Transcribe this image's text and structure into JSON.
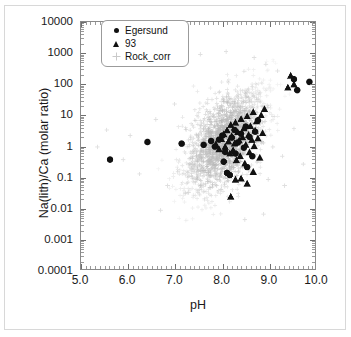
{
  "chart_data": {
    "type": "scatter",
    "title": "",
    "xlabel": "pH",
    "ylabel": "Na(lith)/Ca (molar ratio)",
    "xlim": [
      5.0,
      10.0
    ],
    "ylim": [
      0.0001,
      10000
    ],
    "yscale": "log",
    "xscale": "linear",
    "grid": false,
    "legend_position": "top-left-inside",
    "xticks": [
      "5.0",
      "6.0",
      "7.0",
      "8.0",
      "9.0",
      "10.0"
    ],
    "xtick_values": [
      5.0,
      6.0,
      7.0,
      8.0,
      9.0,
      10.0
    ],
    "yticks": [
      "10000",
      "1000",
      "100",
      "10",
      "1",
      "0.1",
      "0.01",
      "0.001",
      "0.0001"
    ],
    "ytick_values": [
      10000,
      1000,
      100,
      10,
      1,
      0.1,
      0.01,
      0.001,
      0.0001
    ],
    "series": [
      {
        "name": "Egersund",
        "marker": "circle",
        "color": "#111111",
        "size": 6,
        "points": [
          [
            5.62,
            0.35
          ],
          [
            6.42,
            1.3
          ],
          [
            7.15,
            1.15
          ],
          [
            7.62,
            1.05
          ],
          [
            7.78,
            1.4
          ],
          [
            7.86,
            0.92
          ],
          [
            7.95,
            1.55
          ],
          [
            8.02,
            2.1
          ],
          [
            8.08,
            0.62
          ],
          [
            8.05,
            0.3
          ],
          [
            8.12,
            0.13
          ],
          [
            8.18,
            0.11
          ],
          [
            8.22,
            1.8
          ],
          [
            8.28,
            3.2
          ],
          [
            8.3,
            0.55
          ],
          [
            8.35,
            1.25
          ],
          [
            8.42,
            2.4
          ],
          [
            8.48,
            0.85
          ],
          [
            8.52,
            4.1
          ],
          [
            8.55,
            0.2
          ],
          [
            8.6,
            1.9
          ],
          [
            8.66,
            0.45
          ],
          [
            8.72,
            2.8
          ],
          [
            8.78,
            6.5
          ],
          [
            9.55,
            140.0
          ],
          [
            9.62,
            62.0
          ],
          [
            9.88,
            115.0
          ]
        ]
      },
      {
        "name": "93",
        "marker": "triangle",
        "color": "#111111",
        "size": 6,
        "points": [
          [
            7.88,
            1.1
          ],
          [
            7.95,
            0.75
          ],
          [
            8.0,
            1.6
          ],
          [
            8.05,
            2.3
          ],
          [
            8.08,
            0.9
          ],
          [
            8.12,
            3.1
          ],
          [
            8.15,
            1.35
          ],
          [
            8.18,
            0.55
          ],
          [
            8.2,
            4.6
          ],
          [
            8.22,
            2.0
          ],
          [
            8.25,
            0.7
          ],
          [
            8.28,
            1.15
          ],
          [
            8.3,
            5.5
          ],
          [
            8.32,
            0.33
          ],
          [
            8.35,
            2.7
          ],
          [
            8.38,
            1.45
          ],
          [
            8.4,
            0.45
          ],
          [
            8.42,
            7.2
          ],
          [
            8.45,
            1.85
          ],
          [
            8.48,
            3.6
          ],
          [
            8.5,
            0.26
          ],
          [
            8.52,
            1.05
          ],
          [
            8.55,
            8.8
          ],
          [
            8.58,
            2.2
          ],
          [
            8.6,
            0.6
          ],
          [
            8.62,
            4.2
          ],
          [
            8.65,
            1.5
          ],
          [
            8.68,
            12.0
          ],
          [
            8.7,
            0.95
          ],
          [
            8.72,
            3.0
          ],
          [
            8.75,
            6.0
          ],
          [
            8.78,
            1.7
          ],
          [
            8.82,
            0.4
          ],
          [
            8.85,
            9.5
          ],
          [
            8.88,
            2.5
          ],
          [
            8.92,
            15.0
          ],
          [
            8.2,
            0.022
          ],
          [
            8.3,
            0.078
          ],
          [
            8.42,
            0.085
          ],
          [
            8.55,
            0.058
          ],
          [
            8.68,
            0.14
          ],
          [
            9.48,
            180.0
          ],
          [
            9.55,
            95.0
          ],
          [
            9.42,
            75.0
          ]
        ]
      },
      {
        "name": "Rock_corr",
        "marker": "plus",
        "color": "#b9b9b9",
        "size": 4,
        "n_points": 1800,
        "description": "Dense light-grey cloud of plus markers centred near pH 7.8-8.4 with Na(lith)/Ca between 0.03 and 30, spreading up to ~1000 at high pH and down to ~0.003 at the low-ratio tail; sparse outliers from pH 5.2 to 10.0.",
        "cloud": {
          "x_center": 8.05,
          "y_center_log10": 0.15,
          "x_sigma": 0.42,
          "y_sigma_log10": 0.85,
          "correlation": 0.55,
          "x_range": [
            5.2,
            10.0
          ],
          "y_range": [
            0.002,
            1200
          ]
        }
      }
    ]
  },
  "legend": {
    "entries": [
      {
        "label": "Egersund",
        "marker": "circle"
      },
      {
        "label": "93",
        "marker": "triangle"
      },
      {
        "label": "Rock_corr",
        "marker": "plus"
      }
    ]
  },
  "axes": {
    "x_title": "pH",
    "y_title": "Na(lith)/Ca (molar ratio)"
  },
  "colors": {
    "marker_dark": "#111111",
    "marker_light": "#b9b9b9",
    "frame": "#8a8a8a",
    "outer_border": "#d8d8d8",
    "background": "#ffffff",
    "text": "#1a1a1a"
  }
}
